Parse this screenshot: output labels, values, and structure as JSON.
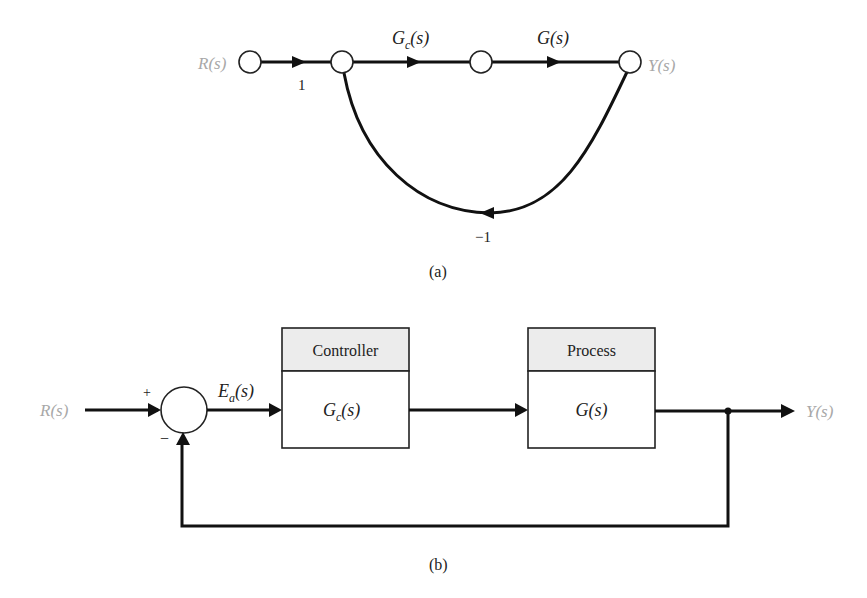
{
  "figure_a": {
    "caption": "(a)",
    "input_label": "R(s)",
    "output_label": "Y(s)",
    "branches": [
      {
        "from": "R(s)",
        "to": "node2",
        "gain": "1"
      },
      {
        "from": "node2",
        "to": "node3",
        "gain": "G_c(s)",
        "gain_main": "G",
        "gain_sub": "c",
        "gain_tail": "(s)"
      },
      {
        "from": "node3",
        "to": "Y(s)",
        "gain": "G(s)"
      },
      {
        "from": "Y(s)",
        "to": "node2",
        "gain": "−1"
      }
    ],
    "nodes": [
      "R(s)",
      "node2",
      "node3",
      "Y(s)"
    ],
    "labels": {
      "one": "1",
      "gc_main": "G",
      "gc_sub": "c",
      "gc_tail": "(s)",
      "g": "G(s)",
      "minus_one": "−1"
    }
  },
  "figure_b": {
    "caption": "(b)",
    "input_label": "R(s)",
    "output_label": "Y(s)",
    "sum_signs": {
      "plus": "+",
      "minus": "−"
    },
    "error_label": {
      "main": "E",
      "sub": "a",
      "tail": "(s)"
    },
    "blocks": [
      {
        "header": "Controller",
        "tf_main": "G",
        "tf_sub": "c",
        "tf_tail": "(s)"
      },
      {
        "header": "Process",
        "tf": "G(s)"
      }
    ]
  },
  "colors": {
    "line": "#111111",
    "signal_label": "#a8a8a8",
    "block_header_bg": "#ececec",
    "block_body_bg": "#ffffff"
  }
}
